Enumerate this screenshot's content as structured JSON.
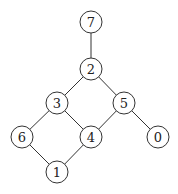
{
  "graph": {
    "type": "hasse-diagram",
    "node_radius": 11,
    "colors": {
      "stroke": "#333333",
      "fill": "#ffffff",
      "text": "#222222"
    },
    "nodes": [
      {
        "id": "7",
        "label": "7",
        "x": 91,
        "y": 22
      },
      {
        "id": "2",
        "label": "2",
        "x": 91,
        "y": 69
      },
      {
        "id": "3",
        "label": "3",
        "x": 57,
        "y": 103
      },
      {
        "id": "5",
        "label": "5",
        "x": 124,
        "y": 103
      },
      {
        "id": "6",
        "label": "6",
        "x": 22,
        "y": 137
      },
      {
        "id": "4",
        "label": "4",
        "x": 91,
        "y": 137
      },
      {
        "id": "0",
        "label": "0",
        "x": 158,
        "y": 137
      },
      {
        "id": "1",
        "label": "1",
        "x": 57,
        "y": 172
      }
    ],
    "edges": [
      {
        "from": "7",
        "to": "2"
      },
      {
        "from": "2",
        "to": "3"
      },
      {
        "from": "2",
        "to": "5"
      },
      {
        "from": "3",
        "to": "6"
      },
      {
        "from": "3",
        "to": "4"
      },
      {
        "from": "5",
        "to": "4"
      },
      {
        "from": "5",
        "to": "0"
      },
      {
        "from": "6",
        "to": "1"
      },
      {
        "from": "4",
        "to": "1"
      }
    ]
  }
}
